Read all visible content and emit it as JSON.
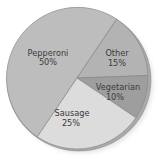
{
  "chart_data": {
    "type": "pie",
    "title": "",
    "categories": [
      "Pepperoni",
      "Other",
      "Vegetarian",
      "Sausage"
    ],
    "values": [
      50,
      15,
      10,
      25
    ],
    "labels": [
      "Pepperoni 50%",
      "Other 15%",
      "Vegetarian 10%",
      "Sausage 25%"
    ],
    "legend": "none (labels inside slices)",
    "colors": {
      "Pepperoni": "#bdbdbd",
      "Other": "#b3b3b3",
      "Vegetarian": "#9e9e9e",
      "Sausage": "#dcdcdc"
    },
    "style": "slightly 3D pie with darker rim on right/bottom edge"
  },
  "slices": [
    {
      "name": "Pepperoni",
      "pct": "50%"
    },
    {
      "name": "Other",
      "pct": "15%"
    },
    {
      "name": "Vegetarian",
      "pct": "10%"
    },
    {
      "name": "Sausage",
      "pct": "25%"
    }
  ]
}
